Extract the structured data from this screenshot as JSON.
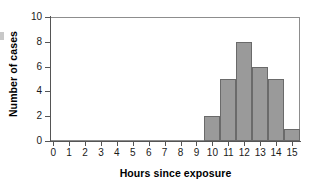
{
  "chart_data": {
    "type": "bar",
    "title": "",
    "subtitle": "",
    "xlabel": "Hours since exposure",
    "ylabel": "Number of cases",
    "categories": [
      10,
      11,
      12,
      13,
      14,
      15
    ],
    "values": [
      2,
      5,
      8,
      6,
      5,
      1
    ],
    "series": [
      {
        "name": "Number of cases",
        "values": [
          2,
          5,
          8,
          6,
          5,
          1
        ]
      }
    ],
    "bins": [
      {
        "center": 10,
        "lower": 9.5,
        "upper": 10.5,
        "count": 2
      },
      {
        "center": 11,
        "lower": 10.5,
        "upper": 11.5,
        "count": 5
      },
      {
        "center": 12,
        "lower": 11.5,
        "upper": 12.5,
        "count": 8
      },
      {
        "center": 13,
        "lower": 12.5,
        "upper": 13.5,
        "count": 6
      },
      {
        "center": 14,
        "lower": 13.5,
        "upper": 14.5,
        "count": 5
      },
      {
        "center": 15,
        "lower": 14.5,
        "upper": 15.5,
        "count": 1
      }
    ],
    "xlim": [
      -0.2,
      15.5
    ],
    "ylim": [
      0,
      10
    ],
    "xticks": [
      0,
      1,
      2,
      3,
      4,
      5,
      6,
      7,
      8,
      9,
      10,
      11,
      12,
      13,
      14,
      15
    ],
    "yticks": [
      0,
      2,
      4,
      6,
      8,
      10
    ],
    "xtick_labels": [
      "0",
      "1",
      "2",
      "3",
      "4",
      "5",
      "6",
      "7",
      "8",
      "9",
      "10",
      "11",
      "12",
      "13",
      "14",
      "15"
    ],
    "ytick_labels": [
      "0",
      "2",
      "4",
      "6",
      "8",
      "10"
    ],
    "grid": false,
    "legend": false,
    "legend_position": "none",
    "annotations": [],
    "colors": {
      "bar_fill": "#9a9a9a",
      "bar_edge": "#6a6a6a",
      "axis": "#555555",
      "frame": "#8d8d8d",
      "text": "#1a1a1a",
      "background": "#ffffff"
    }
  }
}
